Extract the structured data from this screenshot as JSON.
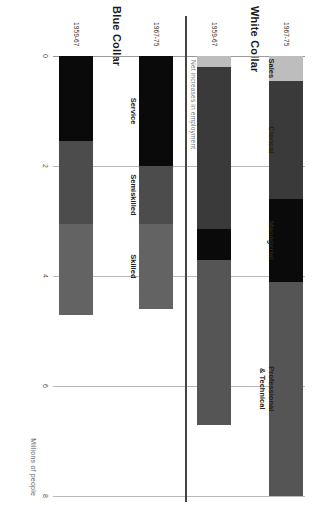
{
  "figure": {
    "note": "Net increases in employment",
    "groups": [
      {
        "title": "Blue Collar"
      },
      {
        "title": "White Collar"
      }
    ]
  },
  "chart_data": {
    "type": "bar",
    "orientation": "horizontal-stacked",
    "title": "Net increases in employment",
    "xlabel": "Millions of people",
    "ylabel": "",
    "xlim": [
      0,
      8
    ],
    "xticks": [
      0,
      2,
      4,
      6,
      8
    ],
    "xticklabels": [
      "0",
      "2",
      "4",
      "6",
      "8"
    ],
    "grid": true,
    "legend": "inline-labels",
    "groups": [
      {
        "name": "Blue Collar",
        "categories": [
          "Service",
          "Semiskilled",
          "Skilled"
        ],
        "colors": [
          "#0a0a0a",
          "#4c4c4c",
          "#636363"
        ],
        "bars": [
          {
            "label": "1959-67",
            "values": [
              1.55,
              1.5,
              1.65
            ],
            "total": 4.7
          },
          {
            "label": "1967-75",
            "values": [
              2.0,
              1.05,
              1.55
            ],
            "total": 4.6
          }
        ]
      },
      {
        "name": "White Collar",
        "categories": [
          "Sales",
          "Clerical",
          "Managerial",
          "Professional\n& Technical"
        ],
        "colors": [
          "#bdbdbd",
          "#3a3a3a",
          "#0a0a0a",
          "#555555"
        ],
        "bars": [
          {
            "label": "1959-67",
            "values": [
              0.2,
              2.95,
              0.55,
              3.0
            ],
            "total": 6.7
          },
          {
            "label": "1967-75",
            "values": [
              0.45,
              2.15,
              1.5,
              3.9
            ],
            "total": 8.0
          }
        ]
      }
    ]
  }
}
